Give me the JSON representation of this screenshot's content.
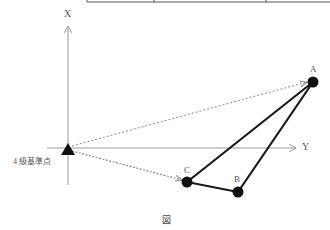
{
  "diagram": {
    "caption": "図",
    "axes": {
      "x_label": "X",
      "y_label": "Y"
    },
    "reference_point": {
      "label": "4 級基準点",
      "symbol": "triangle"
    },
    "points": [
      {
        "id": "A",
        "label": "A"
      },
      {
        "id": "B",
        "label": "B"
      },
      {
        "id": "C",
        "label": "C"
      }
    ],
    "colors": {
      "axis": "#9a9a9a",
      "polygon": "#1a1a1a",
      "dashed": "#8a8a8a",
      "text": "#555555"
    }
  }
}
